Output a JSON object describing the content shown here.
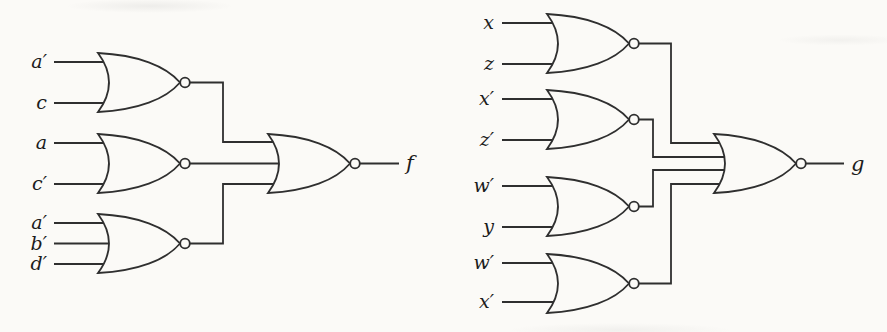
{
  "figure": {
    "type": "logic-circuit-diagram",
    "colors": {
      "paper": "#fbfaf7",
      "ink": "#2f2f2f",
      "label": "#1c1c1c"
    },
    "left_circuit": {
      "output_label": "f",
      "final_gate_type": "NOR",
      "gates": [
        {
          "type": "NOR",
          "inputs": [
            "a′",
            "c"
          ]
        },
        {
          "type": "NOR",
          "inputs": [
            "a",
            "c′"
          ]
        },
        {
          "type": "NOR",
          "inputs": [
            "a′",
            "b′",
            "d′"
          ]
        }
      ]
    },
    "right_circuit": {
      "output_label": "g",
      "final_gate_type": "NOR",
      "gates": [
        {
          "type": "NOR",
          "inputs": [
            "x",
            "z"
          ]
        },
        {
          "type": "NOR",
          "inputs": [
            "x′",
            "z′"
          ]
        },
        {
          "type": "NOR",
          "inputs": [
            "w′",
            "y"
          ]
        },
        {
          "type": "NOR",
          "inputs": [
            "w′",
            "x′"
          ]
        }
      ]
    }
  }
}
